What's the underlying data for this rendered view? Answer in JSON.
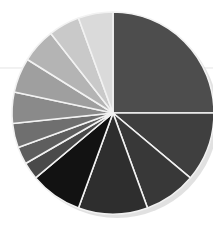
{
  "chart_data": {
    "type": "pie",
    "title": "",
    "subtitle": "",
    "xlabel": "",
    "ylabel": "",
    "legend_position": "none",
    "grid": false,
    "start_angle_deg": -90,
    "direction": "clockwise",
    "center": {
      "x": 113,
      "y": 113
    },
    "radius": 101,
    "slice_border_color": "#f2f2f2",
    "background_color": "#ffffff",
    "categories": [
      "Slice 1",
      "Slice 2",
      "Slice 3",
      "Slice 4",
      "Slice 5",
      "Slice 6",
      "Slice 7",
      "Slice 8",
      "Slice 9",
      "Slice 10",
      "Slice 11",
      "Slice 12",
      "Slice 13"
    ],
    "values": [
      25.0,
      11.1,
      8.3,
      11.1,
      8.3,
      2.8,
      2.8,
      3.9,
      5.0,
      5.6,
      5.6,
      5.0,
      5.5
    ],
    "angles_deg": [
      90.0,
      40.0,
      30.0,
      40.0,
      30.0,
      10.0,
      10.0,
      14.0,
      18.0,
      20.0,
      20.0,
      18.0,
      20.0
    ],
    "colors": [
      "#4d4d4d",
      "#3f3f3f",
      "#383838",
      "#2e2e2e",
      "#121212",
      "#4a4a4a",
      "#5e5e5e",
      "#6f6f6f",
      "#8a8a8a",
      "#9f9f9f",
      "#b4b4b4",
      "#c9c9c9",
      "#dadada"
    ],
    "ylim": [
      0,
      100
    ]
  }
}
